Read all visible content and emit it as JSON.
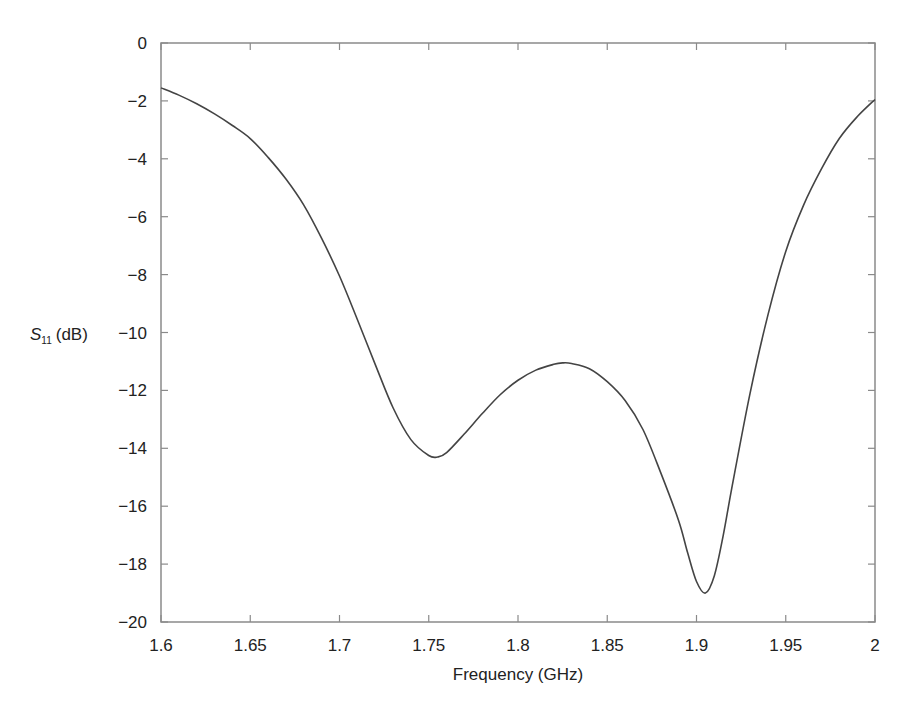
{
  "chart_data": {
    "type": "line",
    "title": "",
    "xlabel": "Frequency (GHz)",
    "ylabel": "S11 (dB)",
    "ylabel_parts": {
      "symbol": "S",
      "subscript": "11",
      "unit": "(dB)"
    },
    "xlim": [
      1.6,
      2.0
    ],
    "ylim": [
      -20,
      0
    ],
    "grid": false,
    "legend": null,
    "x_ticks": [
      1.6,
      1.65,
      1.7,
      1.75,
      1.8,
      1.85,
      1.9,
      1.95,
      2.0
    ],
    "x_tick_labels": [
      "1.6",
      "1.65",
      "1.7",
      "1.75",
      "1.8",
      "1.85",
      "1.9",
      "1.95",
      "2"
    ],
    "y_ticks": [
      0,
      -2,
      -4,
      -6,
      -8,
      -10,
      -12,
      -14,
      -16,
      -18,
      -20
    ],
    "y_tick_labels": [
      "0",
      "−2",
      "−4",
      "−6",
      "−8",
      "−10",
      "−12",
      "−14",
      "−16",
      "−18",
      "−20"
    ],
    "series": [
      {
        "name": "S11",
        "color": "#444444",
        "x": [
          1.6,
          1.61,
          1.62,
          1.63,
          1.64,
          1.65,
          1.66,
          1.67,
          1.68,
          1.69,
          1.7,
          1.71,
          1.72,
          1.73,
          1.74,
          1.75,
          1.755,
          1.76,
          1.77,
          1.78,
          1.79,
          1.8,
          1.81,
          1.82,
          1.825,
          1.83,
          1.84,
          1.85,
          1.86,
          1.87,
          1.88,
          1.89,
          1.895,
          1.9,
          1.905,
          1.91,
          1.915,
          1.92,
          1.93,
          1.94,
          1.95,
          1.96,
          1.97,
          1.98,
          1.99,
          2.0
        ],
        "values": [
          -1.55,
          -1.8,
          -2.1,
          -2.45,
          -2.85,
          -3.3,
          -3.95,
          -4.7,
          -5.6,
          -6.75,
          -8.05,
          -9.55,
          -11.1,
          -12.6,
          -13.7,
          -14.25,
          -14.3,
          -14.15,
          -13.5,
          -12.8,
          -12.15,
          -11.65,
          -11.3,
          -11.1,
          -11.05,
          -11.07,
          -11.25,
          -11.7,
          -12.35,
          -13.35,
          -14.85,
          -16.5,
          -17.6,
          -18.6,
          -19.0,
          -18.4,
          -17.0,
          -15.3,
          -12.1,
          -9.4,
          -7.2,
          -5.6,
          -4.35,
          -3.3,
          -2.55,
          -1.95
        ]
      }
    ],
    "annotations": []
  }
}
